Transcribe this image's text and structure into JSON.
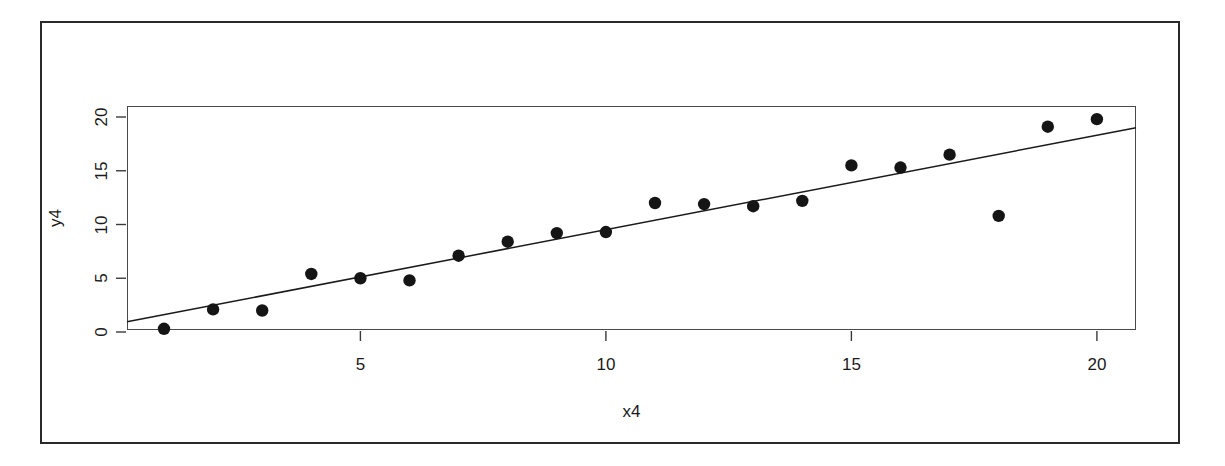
{
  "chart_data": {
    "type": "scatter",
    "title": "",
    "subtitle": "",
    "xlabel": "x4",
    "ylabel": "y4",
    "xlim": [
      0.5,
      20.9
    ],
    "ylim": [
      -0.6,
      21.4
    ],
    "xticks": [
      5,
      10,
      15,
      20
    ],
    "xtick_labels": [
      "5",
      "10",
      "15",
      "20"
    ],
    "yticks": [
      0,
      5,
      10,
      15,
      20
    ],
    "ytick_labels": [
      "0",
      "5",
      "10",
      "15",
      "20"
    ],
    "grid": false,
    "legend": null,
    "point_color": "#151515",
    "line_color": "#1a1a1a",
    "x": [
      1,
      2,
      3,
      4,
      5,
      6,
      7,
      8,
      9,
      10,
      11,
      12,
      13,
      14,
      15,
      16,
      17,
      18,
      19,
      20
    ],
    "y": [
      0.3,
      2.1,
      2.0,
      5.4,
      5.0,
      4.8,
      7.1,
      8.4,
      9.2,
      9.3,
      12.0,
      11.9,
      11.7,
      12.2,
      15.5,
      15.3,
      16.5,
      10.8,
      19.1,
      19.8
    ],
    "series": [
      {
        "name": "y4 vs x4",
        "type": "scatter",
        "marker": "filled-circle",
        "values": [
          0.3,
          2.1,
          2.0,
          5.4,
          5.0,
          4.8,
          7.1,
          8.4,
          9.2,
          9.3,
          12.0,
          11.9,
          11.7,
          12.2,
          15.5,
          15.3,
          16.5,
          10.8,
          19.1,
          19.8
        ]
      },
      {
        "name": "fitted regression line",
        "type": "line",
        "endpoints": [
          [
            0.5,
            0.95
          ],
          [
            20.9,
            19.0
          ]
        ]
      }
    ],
    "annotations": []
  },
  "figure": {
    "frame_name": "page-frame",
    "background": "#ffffff"
  }
}
